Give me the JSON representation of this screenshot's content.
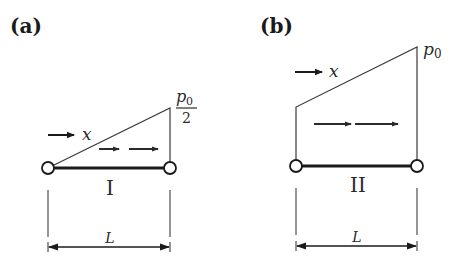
{
  "panels": [
    {
      "id": "a",
      "label": "(a)",
      "member_label": "I",
      "load_direction_label": "x",
      "load_shape": "triangular",
      "load_left": "0",
      "load_right_numerator": "p0",
      "load_right_numerator_base": "p",
      "load_right_numerator_sub": "0",
      "load_right_denominator": "2",
      "span_label": "L"
    },
    {
      "id": "b",
      "label": "(b)",
      "member_label": "II",
      "load_direction_label": "x",
      "load_shape": "trapezoidal",
      "load_right_base": "p",
      "load_right_sub": "0",
      "span_label": "L"
    }
  ]
}
